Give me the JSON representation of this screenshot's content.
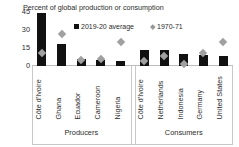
{
  "chart_data": {
    "type": "bar",
    "title": "Percent of global production or consumption",
    "xlabel": "",
    "ylabel": "",
    "ylim": [
      0,
      45
    ],
    "yticks": [
      0,
      15,
      30,
      45
    ],
    "grid": false,
    "legend_position": "top-center",
    "categories": [
      "Côte d'Ivoire",
      "Ghana",
      "Ecuador",
      "Cameroon",
      "Nigeria",
      "Côte d'Ivoire",
      "Netherlands",
      "Indonesia",
      "Germany",
      "United States"
    ],
    "series": [
      {
        "name": "2019-20 average",
        "type": "bar",
        "color": "#111111",
        "values": [
          44,
          18,
          6,
          5,
          4,
          13,
          13,
          10,
          9,
          8
        ]
      },
      {
        "name": "1970-71",
        "type": "scatter",
        "marker": "diamond",
        "color": "#a0a0a0",
        "values": [
          11,
          27,
          5,
          6,
          20,
          4,
          8,
          2,
          11,
          20
        ]
      }
    ],
    "groups": [
      {
        "label": "Producers",
        "categories": [
          "Côte d'Ivoire",
          "Ghana",
          "Ecuador",
          "Cameroon",
          "Nigeria"
        ]
      },
      {
        "label": "Consumers",
        "categories": [
          "Côte d'Ivoire",
          "Netherlands",
          "Indonesia",
          "Germany",
          "United States"
        ]
      }
    ]
  },
  "legend": {
    "entries": [
      {
        "label": "2019-20 average",
        "marker": "square",
        "color": "#111111"
      },
      {
        "label": "1970-71",
        "marker": "diamond",
        "color": "#a0a0a0"
      }
    ]
  },
  "axis": {
    "y_ticks": [
      "45",
      "30",
      "15",
      "0"
    ]
  }
}
